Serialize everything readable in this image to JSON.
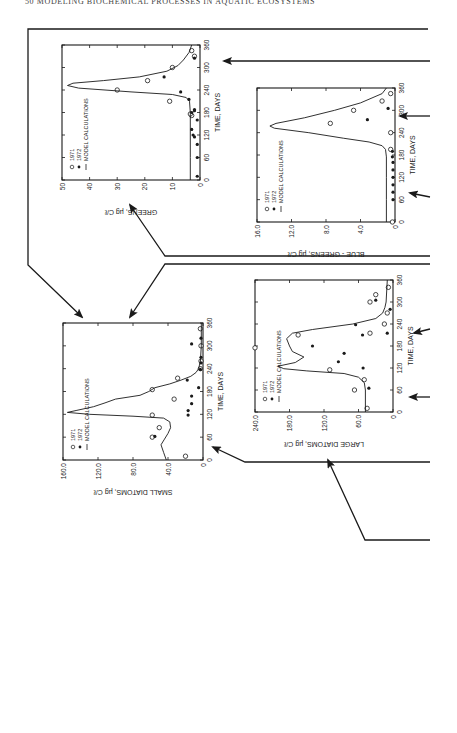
{
  "page": {
    "running_head": "50   MODELING BIOCHEMICAL PROCESSES IN AQUATIC ECOSYSTEMS",
    "orientation": "figure rotated 90 degrees (landscape)"
  },
  "legend": {
    "items": [
      {
        "symbol": "open-circle",
        "label": "1971"
      },
      {
        "symbol": "filled-circle",
        "label": "1972"
      },
      {
        "symbol": "line",
        "label": "MODEL CALCULATIONS"
      }
    ]
  },
  "chart_data": [
    {
      "id": "greens",
      "type": "scatter",
      "title": "",
      "xlabel": "TIME, DAYS",
      "ylabel": "GREENS, µg C/ℓ",
      "xlim": [
        0,
        360
      ],
      "ylim": [
        0,
        50
      ],
      "xticks": [
        0,
        60,
        120,
        180,
        240,
        300,
        360
      ],
      "yticks": [
        0,
        10,
        20,
        30,
        40,
        50
      ],
      "ytick_labels": [
        "0",
        "10",
        "20",
        "30",
        "40",
        "50"
      ],
      "grid": false,
      "legend_position": "upper left",
      "series": [
        {
          "name": "1971",
          "marker": "open-circle",
          "x": [
            172,
            176,
            210,
            240,
            265,
            300,
            330,
            345
          ],
          "y": [
            3,
            3.5,
            11,
            30,
            19,
            10,
            2,
            3
          ]
        },
        {
          "name": "1972",
          "marker": "filled-circle",
          "x": [
            10,
            60,
            95,
            115,
            120,
            135,
            160,
            180,
            185,
            188,
            215,
            235,
            275,
            325
          ],
          "y": [
            1,
            1,
            1,
            2,
            2.5,
            3,
            1,
            3,
            2,
            2,
            4,
            7,
            13,
            2
          ]
        },
        {
          "name": "MODEL CALCULATIONS",
          "marker": "line",
          "x": [
            0,
            60,
            120,
            180,
            210,
            220,
            228,
            235,
            245,
            252,
            258,
            265,
            275,
            290,
            305,
            320,
            340,
            360
          ],
          "y": [
            3.5,
            3.5,
            3.5,
            3.5,
            3.8,
            5,
            10,
            25,
            44,
            48,
            46,
            35,
            22,
            12,
            8,
            6,
            4,
            3
          ]
        }
      ]
    },
    {
      "id": "blue-greens",
      "type": "scatter",
      "title": "",
      "xlabel": "TIME, DAYS",
      "ylabel": "BLUE - GREENS, µg C/ℓ",
      "xlim": [
        0,
        360
      ],
      "ylim": [
        0,
        16.0
      ],
      "xticks": [
        0,
        60,
        120,
        180,
        240,
        300,
        360
      ],
      "yticks": [
        0,
        4.0,
        8.0,
        12.0,
        16.0
      ],
      "ytick_labels": [
        "0",
        "4.0",
        "8.0",
        "12.0",
        "16.0"
      ],
      "grid": false,
      "legend_position": "upper left",
      "series": [
        {
          "name": "1971",
          "marker": "open-circle",
          "x": [
            0,
            195,
            240,
            265,
            300,
            325,
            345
          ],
          "y": [
            0.3,
            0.5,
            0.5,
            7.5,
            4.8,
            1.5,
            0.5
          ]
        },
        {
          "name": "1972",
          "marker": "filled-circle",
          "x": [
            60,
            80,
            100,
            120,
            140,
            160,
            175,
            190,
            275,
            305
          ],
          "y": [
            0.2,
            0.2,
            0.2,
            0.2,
            0.2,
            0.2,
            0.3,
            0.3,
            3.2,
            0.8
          ]
        },
        {
          "name": "MODEL CALCULATIONS",
          "marker": "line",
          "x": [
            0,
            60,
            120,
            175,
            195,
            205,
            215,
            225,
            240,
            252,
            258,
            265,
            280,
            300,
            320,
            345,
            360
          ],
          "y": [
            1.0,
            1.0,
            1.0,
            1.0,
            1.1,
            1.5,
            3,
            6,
            10,
            14,
            14.5,
            13.8,
            10.5,
            7,
            4,
            1.5,
            1.0
          ]
        }
      ]
    },
    {
      "id": "small-diatoms",
      "type": "scatter",
      "title": "",
      "xlabel": "TIME, DAYS",
      "ylabel": "SMALL DIATOMS, µg C/ℓ",
      "xlim": [
        0,
        360
      ],
      "ylim": [
        0,
        160.0
      ],
      "xticks": [
        0,
        60,
        120,
        180,
        240,
        300,
        360
      ],
      "yticks": [
        0,
        40.0,
        80.0,
        120.0,
        160.0
      ],
      "ytick_labels": [
        "0",
        "40.0",
        "80.0",
        "120.0",
        "160.0"
      ],
      "grid": false,
      "legend_position": "upper left",
      "series": [
        {
          "name": "1971",
          "marker": "open-circle",
          "x": [
            10,
            60,
            85,
            118,
            160,
            185,
            215,
            240,
            260,
            300,
            345
          ],
          "y": [
            20,
            58,
            50,
            58,
            33,
            58,
            29,
            3,
            2,
            2,
            3
          ]
        },
        {
          "name": "1972",
          "marker": "filled-circle",
          "x": [
            62,
            118,
            130,
            148,
            168,
            190,
            210,
            238,
            255,
            270,
            305,
            320
          ],
          "y": [
            55,
            17,
            17,
            13,
            13,
            5,
            18,
            3,
            2,
            2,
            13,
            1
          ]
        },
        {
          "name": "MODEL CALCULATIONS",
          "marker": "line",
          "x": [
            0,
            20,
            40,
            55,
            70,
            85,
            100,
            110,
            115,
            120,
            125,
            130,
            140,
            150,
            160,
            170,
            180,
            190,
            200,
            210,
            220,
            230,
            240,
            260,
            300,
            360
          ],
          "y": [
            42,
            45,
            48,
            44,
            40,
            37,
            38,
            45,
            80,
            130,
            155,
            145,
            125,
            112,
            100,
            72,
            62,
            55,
            38,
            25,
            14,
            8,
            5,
            3,
            2,
            2
          ]
        }
      ]
    },
    {
      "id": "large-diatoms",
      "type": "scatter",
      "title": "",
      "xlabel": "TIME, DAYS",
      "ylabel": "LARGE DIATOMS, µg C/ℓ",
      "xlim": [
        0,
        360
      ],
      "ylim": [
        0,
        240.0
      ],
      "xticks": [
        0,
        60,
        120,
        180,
        240,
        300,
        360
      ],
      "yticks": [
        0,
        60.0,
        120.0,
        180.0,
        240.0
      ],
      "ytick_labels": [
        "0",
        "60.0",
        "120.0",
        "180.0",
        "240.0"
      ],
      "grid": false,
      "legend_position": "upper left",
      "series": [
        {
          "name": "1971",
          "marker": "open-circle",
          "x": [
            10,
            60,
            88,
            115,
            175,
            210,
            215,
            240,
            270,
            300,
            320,
            340
          ],
          "y": [
            45,
            67,
            50,
            110,
            240,
            165,
            40,
            15,
            10,
            40,
            30,
            8
          ]
        },
        {
          "name": "1972",
          "marker": "filled-circle",
          "x": [
            65,
            120,
            137,
            160,
            180,
            210,
            215,
            238,
            280,
            305
          ],
          "y": [
            42,
            52,
            95,
            85,
            140,
            53,
            10,
            65,
            5,
            30
          ]
        },
        {
          "name": "MODEL CALCULATIONS",
          "marker": "line",
          "x": [
            0,
            60,
            80,
            95,
            105,
            112,
            118,
            125,
            135,
            150,
            165,
            180,
            200,
            215,
            225,
            240,
            255,
            270,
            285,
            300,
            330,
            360
          ],
          "y": [
            48,
            48,
            50,
            60,
            85,
            150,
            190,
            200,
            170,
            155,
            175,
            180,
            185,
            175,
            140,
            70,
            30,
            18,
            14,
            12,
            11,
            10
          ]
        }
      ]
    }
  ],
  "layout": {
    "chart_positions": {
      "greens": {
        "left": 62,
        "top": 45,
        "width": 138,
        "height": 135,
        "rotation": -90
      },
      "blue-greens": {
        "left": 257,
        "top": 88,
        "width": 138,
        "height": 134,
        "rotation": -90
      },
      "small-diatoms": {
        "left": 63,
        "top": 323,
        "width": 140,
        "height": 137,
        "rotation": -90
      },
      "large-diatoms": {
        "left": 255,
        "top": 280,
        "width": 138,
        "height": 132,
        "rotation": -90
      }
    },
    "ink_color": "#1a1a1a"
  }
}
